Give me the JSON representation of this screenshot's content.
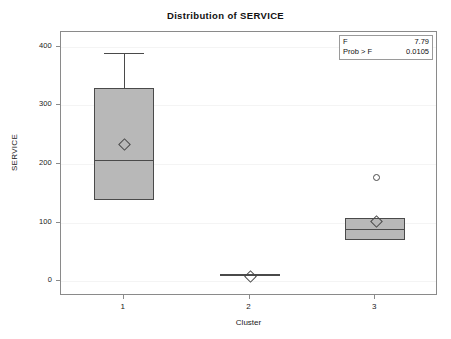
{
  "chart_data": {
    "type": "box",
    "title": "Distribution of SERVICE",
    "xlabel": "Cluster",
    "ylabel": "SERVICE",
    "categories": [
      "1",
      "2",
      "3"
    ],
    "ylim": [
      -25,
      425
    ],
    "yticks": [
      0,
      100,
      200,
      300,
      400
    ],
    "ytick_labels": [
      "0",
      "100",
      "200",
      "300",
      "400"
    ],
    "grid": true,
    "legend": "none",
    "boxes": [
      {
        "category": "1",
        "whisker_high": 390,
        "q3": 330,
        "median": 206,
        "q1": 139,
        "whisker_low": 139,
        "mean": 235,
        "outliers": []
      },
      {
        "category": "2",
        "whisker_high": 10,
        "q3": 10,
        "median": 10,
        "q1": 10,
        "whisker_low": 10,
        "mean": 10,
        "outliers": []
      },
      {
        "category": "3",
        "whisker_high": 108,
        "q3": 108,
        "median": 89,
        "q1": 70,
        "whisker_low": 70,
        "mean": 103,
        "outliers": [
          178
        ]
      }
    ],
    "annotations": {
      "f_label": "F",
      "f_value": "7.79",
      "prob_label": "Prob > F",
      "prob_value": "0.0105"
    },
    "colors": {
      "box_fill": "#b8b8b8",
      "box_edge": "#4a4a4a",
      "axis": "#8a8a8a",
      "grid": "#f4f4f4",
      "text": "#1a1a1a"
    }
  }
}
